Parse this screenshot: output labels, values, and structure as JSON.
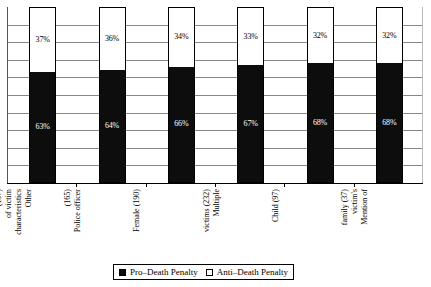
{
  "chart_data": {
    "type": "bar",
    "subtype": "100% stacked column",
    "title": "",
    "xlabel": "",
    "ylabel": "",
    "ylim": [
      0,
      100
    ],
    "y_tick_labels": [],
    "grid": true,
    "gridline_count": 10,
    "legend_position": "bottom",
    "categories": [
      "Other characteristics of victim (197)",
      "Police officer (165)",
      "Female (190)",
      "Multiple victims (232)",
      "Child (97)",
      "Mention of victim's family (37)"
    ],
    "category_lines": [
      [
        "Other",
        "characteristics",
        "of victim",
        "(197)"
      ],
      [
        "Police officer",
        "(165)"
      ],
      [
        "Female (190)"
      ],
      [
        "Multiple",
        "victims (232)"
      ],
      [
        "Child (97)"
      ],
      [
        "Mention of",
        "victim's",
        "family (37)"
      ]
    ],
    "series": [
      {
        "name": "Pro–Death Penalty",
        "color": "#0d0d0d",
        "values": [
          63,
          64,
          66,
          67,
          68,
          68
        ],
        "value_labels": [
          "63%",
          "64%",
          "66%",
          "67%",
          "68%",
          "68%"
        ]
      },
      {
        "name": "Anti–Death Penalty",
        "color": "#ffffff",
        "values": [
          37,
          36,
          34,
          33,
          32,
          32
        ],
        "value_labels": [
          "37%",
          "36%",
          "34%",
          "33%",
          "32%",
          "32%"
        ]
      }
    ]
  },
  "legend": {
    "pro_label": "Pro–Death Penalty",
    "anti_label": "Anti–Death Penalty"
  }
}
